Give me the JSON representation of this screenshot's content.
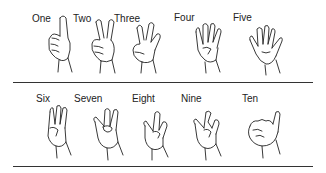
{
  "rows": [
    {
      "items": [
        {
          "number": 1,
          "label": "One"
        },
        {
          "number": 2,
          "label": "Two"
        },
        {
          "number": 3,
          "label": "Three"
        },
        {
          "number": 4,
          "label": "Four"
        },
        {
          "number": 5,
          "label": "Five"
        }
      ]
    },
    {
      "items": [
        {
          "number": 6,
          "label": "Six"
        },
        {
          "number": 7,
          "label": "Seven"
        },
        {
          "number": 8,
          "label": "Eight"
        },
        {
          "number": 9,
          "label": "Nine"
        },
        {
          "number": 10,
          "label": "Ten"
        }
      ]
    }
  ],
  "colors": {
    "line": "#333333",
    "text": "#222222",
    "background": "#ffffff"
  }
}
